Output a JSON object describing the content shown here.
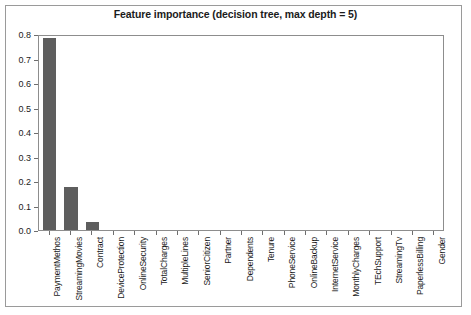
{
  "chart_data": {
    "type": "bar",
    "title": "Feature importance (decision tree, max depth = 5)",
    "xlabel": "",
    "ylabel": "",
    "ylim": [
      0.0,
      0.8
    ],
    "grid": false,
    "legend": null,
    "orientation": "vertical",
    "bar_color": "#5e5e5e",
    "ytick_labels": [
      "0.0",
      "0.1",
      "0.2",
      "0.3",
      "0.4",
      "0.5",
      "0.6",
      "0.7",
      "0.8"
    ],
    "yticks": [
      0.0,
      0.1,
      0.2,
      0.3,
      0.4,
      0.5,
      0.6,
      0.7,
      0.8
    ],
    "categories": [
      "PaymentMethos",
      "StreamingMovies",
      "Contract",
      "DeviceProtection",
      "OnlineSecurity",
      "TotalCharges",
      "MultipleLines",
      "SeniorCitizen",
      "Partner",
      "Dependents",
      "Tenure",
      "PhoneService",
      "OnlineBackup",
      "InternetService",
      "MonthlyCharges",
      "TEchSupport",
      "StreamingTv",
      "PaperlessBilling",
      "Gender"
    ],
    "values": [
      0.785,
      0.175,
      0.032,
      0.0,
      0.0,
      0.0,
      0.0,
      0.0,
      0.0,
      0.0,
      0.0,
      0.0,
      0.0,
      0.0,
      0.0,
      0.0,
      0.0,
      0.0,
      0.0
    ]
  }
}
